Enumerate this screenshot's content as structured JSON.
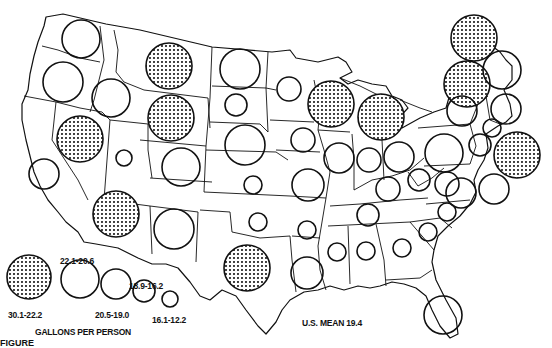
{
  "figure": {
    "legend_title": "GALLONS PER PERSON",
    "mean_label": "U.S. MEAN 19.4",
    "caption_partial": "FIGURE"
  },
  "legend": {
    "items": [
      {
        "label": "30.1-22.2",
        "class": "highest",
        "r": 22,
        "filled": true,
        "cx": 29,
        "cy": 277,
        "lx": 8,
        "ly": 310
      },
      {
        "label": "22.1-20.6",
        "class": "high",
        "r": 19,
        "filled": false,
        "cx": 80,
        "cy": 279,
        "lx": 60,
        "ly": 256
      },
      {
        "label": "20.5-19.0",
        "class": "middle",
        "r": 15,
        "filled": false,
        "cx": 116,
        "cy": 284,
        "lx": 95,
        "ly": 310
      },
      {
        "label": "18.9-16.2",
        "class": "low",
        "r": 11,
        "filled": false,
        "cx": 144,
        "cy": 291,
        "lx": 129,
        "ly": 281
      },
      {
        "label": "16.1-12.2",
        "class": "lowest",
        "r": 8,
        "filled": false,
        "cx": 170,
        "cy": 299,
        "lx": 152,
        "ly": 315
      }
    ]
  },
  "chart_data": {
    "type": "proportional-symbol-map",
    "mean": 19.4,
    "classes": [
      "30.1-22.2",
      "22.1-20.6",
      "20.5-19.0",
      "18.9-16.2",
      "16.1-12.2"
    ],
    "states": [
      {
        "state": "WA",
        "class": "22.1-20.6",
        "cx": 81,
        "cy": 39,
        "r": 19,
        "filled": false
      },
      {
        "state": "OR",
        "class": "22.1-20.6",
        "cx": 63,
        "cy": 82,
        "r": 20,
        "filled": false
      },
      {
        "state": "ID",
        "class": "22.1-20.6",
        "cx": 111,
        "cy": 98,
        "r": 19,
        "filled": false
      },
      {
        "state": "MT",
        "class": "30.1-22.2",
        "cx": 169,
        "cy": 66,
        "r": 23,
        "filled": true
      },
      {
        "state": "WY",
        "class": "30.1-22.2",
        "cx": 171,
        "cy": 118,
        "r": 23,
        "filled": true
      },
      {
        "state": "NV",
        "class": "30.1-22.2",
        "cx": 80,
        "cy": 139,
        "r": 23,
        "filled": true
      },
      {
        "state": "CA",
        "class": "20.5-19.0",
        "cx": 44,
        "cy": 174,
        "r": 15,
        "filled": false
      },
      {
        "state": "UT",
        "class": "16.1-12.2",
        "cx": 124,
        "cy": 158,
        "r": 8,
        "filled": false
      },
      {
        "state": "CO",
        "class": "22.1-20.6",
        "cx": 181,
        "cy": 167,
        "r": 19,
        "filled": false
      },
      {
        "state": "AZ",
        "class": "30.1-22.2",
        "cx": 116,
        "cy": 214,
        "r": 23,
        "filled": true
      },
      {
        "state": "NM",
        "class": "22.1-20.6",
        "cx": 174,
        "cy": 229,
        "r": 20,
        "filled": false
      },
      {
        "state": "ND",
        "class": "22.1-20.6",
        "cx": 240,
        "cy": 69,
        "r": 20,
        "filled": false
      },
      {
        "state": "SD",
        "class": "18.9-16.2",
        "cx": 236,
        "cy": 105,
        "r": 11,
        "filled": false
      },
      {
        "state": "NE",
        "class": "22.1-20.6",
        "cx": 245,
        "cy": 145,
        "r": 20,
        "filled": false
      },
      {
        "state": "KS",
        "class": "16.1-12.2",
        "cx": 253,
        "cy": 185,
        "r": 9,
        "filled": false
      },
      {
        "state": "OK",
        "class": "16.1-12.2",
        "cx": 258,
        "cy": 222,
        "r": 9,
        "filled": false
      },
      {
        "state": "TX",
        "class": "30.1-22.2",
        "cx": 247,
        "cy": 268,
        "r": 23,
        "filled": true
      },
      {
        "state": "MN",
        "class": "18.9-16.2",
        "cx": 289,
        "cy": 89,
        "r": 12,
        "filled": false
      },
      {
        "state": "IA",
        "class": "18.9-16.2",
        "cx": 303,
        "cy": 140,
        "r": 12,
        "filled": false
      },
      {
        "state": "MO",
        "class": "20.5-19.0",
        "cx": 308,
        "cy": 185,
        "r": 16,
        "filled": false
      },
      {
        "state": "AR",
        "class": "16.1-12.2",
        "cx": 307,
        "cy": 230,
        "r": 9,
        "filled": false
      },
      {
        "state": "LA",
        "class": "20.5-19.0",
        "cx": 307,
        "cy": 273,
        "r": 16,
        "filled": false
      },
      {
        "state": "WI",
        "class": "30.1-22.2",
        "cx": 331,
        "cy": 104,
        "r": 23,
        "filled": true
      },
      {
        "state": "MI",
        "class": "30.1-22.2",
        "cx": 381,
        "cy": 117,
        "r": 23,
        "filled": true
      },
      {
        "state": "IL",
        "class": "20.5-19.0",
        "cx": 339,
        "cy": 158,
        "r": 15,
        "filled": false
      },
      {
        "state": "IN",
        "class": "18.9-16.2",
        "cx": 369,
        "cy": 160,
        "r": 12,
        "filled": false
      },
      {
        "state": "OH",
        "class": "20.5-19.0",
        "cx": 399,
        "cy": 157,
        "r": 15,
        "filled": false
      },
      {
        "state": "KY",
        "class": "18.9-16.2",
        "cx": 388,
        "cy": 189,
        "r": 12,
        "filled": false
      },
      {
        "state": "TN",
        "class": "18.9-16.2",
        "cx": 368,
        "cy": 215,
        "r": 11,
        "filled": false
      },
      {
        "state": "MS",
        "class": "16.1-12.2",
        "cx": 337,
        "cy": 252,
        "r": 9,
        "filled": false
      },
      {
        "state": "AL",
        "class": "16.1-12.2",
        "cx": 366,
        "cy": 251,
        "r": 9,
        "filled": false
      },
      {
        "state": "GA",
        "class": "16.1-12.2",
        "cx": 402,
        "cy": 248,
        "r": 9,
        "filled": false
      },
      {
        "state": "FL",
        "class": "20.5-19.0",
        "cx": 443,
        "cy": 315,
        "r": 19,
        "filled": false
      },
      {
        "state": "SC",
        "class": "16.1-12.2",
        "cx": 428,
        "cy": 232,
        "r": 9,
        "filled": false
      },
      {
        "state": "NC",
        "class": "18.9-16.2",
        "cx": 447,
        "cy": 212,
        "r": 9,
        "filled": false
      },
      {
        "state": "WV",
        "class": "18.9-16.2",
        "cx": 419,
        "cy": 180,
        "r": 11,
        "filled": false
      },
      {
        "state": "VA",
        "class": "18.9-16.2",
        "cx": 447,
        "cy": 184,
        "r": 12,
        "filled": false
      },
      {
        "state": "PA",
        "class": "22.1-20.6",
        "cx": 444,
        "cy": 153,
        "r": 19,
        "filled": false
      },
      {
        "state": "NY",
        "class": "30.1-22.2",
        "cx": 467,
        "cy": 84,
        "r": 23,
        "filled": true
      },
      {
        "state": "ME",
        "class": "30.1-22.2",
        "cx": 474,
        "cy": 38,
        "r": 23,
        "filled": true
      },
      {
        "state": "VT",
        "class": "20.5-19.0",
        "cx": 462,
        "cy": 111,
        "r": 15,
        "filled": false
      },
      {
        "state": "NH",
        "class": "20.5-19.0",
        "cx": 502,
        "cy": 70,
        "r": 19,
        "filled": false
      },
      {
        "state": "MA",
        "class": "18.9-16.2",
        "cx": 506,
        "cy": 109,
        "r": 15,
        "filled": false
      },
      {
        "state": "CT",
        "class": "16.1-12.2",
        "cx": 492,
        "cy": 128,
        "r": 9,
        "filled": false
      },
      {
        "state": "NJ",
        "class": "16.1-12.2",
        "cx": 480,
        "cy": 145,
        "r": 11,
        "filled": false
      },
      {
        "state": "RI",
        "class": "30.1-22.2",
        "cx": 517,
        "cy": 155,
        "r": 23,
        "filled": true
      },
      {
        "state": "DE",
        "class": "20.5-19.0",
        "cx": 494,
        "cy": 189,
        "r": 15,
        "filled": false
      },
      {
        "state": "MD",
        "class": "20.5-19.0",
        "cx": 461,
        "cy": 193,
        "r": 15,
        "filled": false
      }
    ]
  }
}
